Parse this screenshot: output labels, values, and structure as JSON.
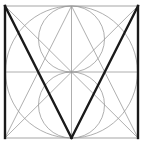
{
  "diagram": {
    "frame": {
      "x": 5,
      "y": 6,
      "width": 133,
      "height": 132
    },
    "colors": {
      "background": "#ffffff",
      "guide": "#9a9a9a",
      "frame": "#b5b5b5",
      "stroke": "#1a1a1a"
    },
    "guides": {
      "big_circle": {
        "cx": 71.5,
        "cy": 72,
        "r": 66
      },
      "upper_circle": {
        "cx": 71.5,
        "cy": 39,
        "r": 33
      },
      "lower_circle": {
        "cx": 71.5,
        "cy": 105,
        "r": 33
      },
      "lines": [
        {
          "name": "vertical-center",
          "x1": 71.5,
          "y1": 6,
          "x2": 71.5,
          "y2": 138
        },
        {
          "name": "horizontal-center",
          "x1": 5,
          "y1": 72,
          "x2": 138,
          "y2": 72
        },
        {
          "name": "diagonal-tl-br",
          "x1": 5,
          "y1": 6,
          "x2": 138,
          "y2": 138
        },
        {
          "name": "diagonal-tr-bl",
          "x1": 138,
          "y1": 6,
          "x2": 5,
          "y2": 138
        },
        {
          "name": "apex-to-bl",
          "x1": 71.5,
          "y1": 6,
          "x2": 5,
          "y2": 138
        },
        {
          "name": "apex-to-br",
          "x1": 71.5,
          "y1": 6,
          "x2": 138,
          "y2": 138
        }
      ]
    },
    "letter_strokes": [
      {
        "name": "left-stem",
        "x1": 5,
        "y1": 6,
        "x2": 5,
        "y2": 138
      },
      {
        "name": "left-diagonal",
        "x1": 5,
        "y1": 6,
        "x2": 71.5,
        "y2": 138
      },
      {
        "name": "right-diagonal",
        "x1": 138,
        "y1": 6,
        "x2": 71.5,
        "y2": 138
      },
      {
        "name": "right-stem",
        "x1": 138,
        "y1": 6,
        "x2": 138,
        "y2": 138
      }
    ]
  }
}
